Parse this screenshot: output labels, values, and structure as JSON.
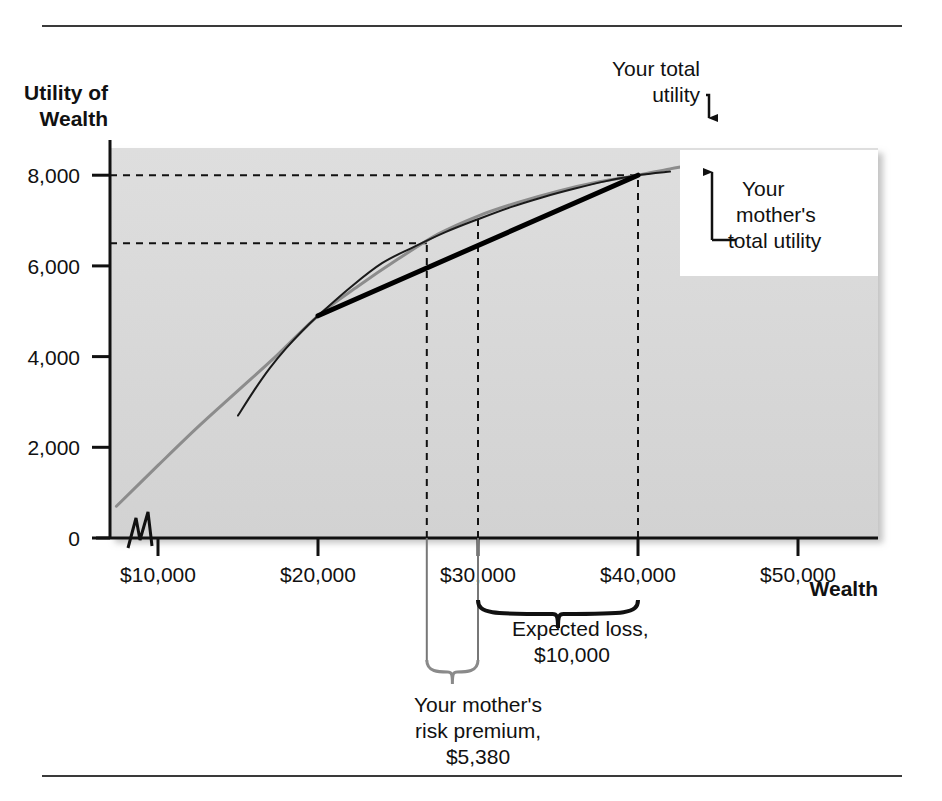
{
  "figure": {
    "background_color": "#ffffff",
    "plot_fill_color": "#d9d9d9",
    "your_curve_color": "#8c8c8c",
    "mother_curve_color": "#1a1a1a",
    "chord_color": "#000000"
  },
  "axes": {
    "y_title_line1": "Utility of",
    "y_title_line2": "Wealth",
    "x_title": "Wealth",
    "y_ticks": [
      "0",
      "2,000",
      "4,000",
      "6,000",
      "8,000"
    ],
    "x_ticks": [
      "$10,000",
      "$20,000",
      "$30,000",
      "$40,000",
      "$50,000"
    ],
    "axis_break_symbol": "zigzag"
  },
  "annotations": {
    "your_total_utility": "Your total\nutility",
    "your_total_utility_l1": "Your total",
    "your_total_utility_l2": "utility",
    "mothers_total_utility_l1": "Your",
    "mothers_total_utility_l2": "mother's",
    "mothers_total_utility_l3": "total utility",
    "expected_loss_l1": "Expected loss,",
    "expected_loss_l2": "$10,000",
    "risk_premium_l1": "Your mother's",
    "risk_premium_l2": "risk premium,",
    "risk_premium_l3": "$5,380"
  },
  "chart_data": {
    "type": "line",
    "title": "",
    "xlabel": "Wealth",
    "ylabel": "Utility of Wealth",
    "xlim": [
      7000,
      55000
    ],
    "ylim": [
      0,
      8600
    ],
    "xticks": [
      10000,
      20000,
      30000,
      40000,
      50000
    ],
    "xticklabels": [
      "$10,000",
      "$20,000",
      "$30,000",
      "$40,000",
      "$50,000"
    ],
    "yticks": [
      0,
      2000,
      4000,
      6000,
      8000
    ],
    "yticklabels": [
      "0",
      "2,000",
      "4,000",
      "6,000",
      "8,000"
    ],
    "grid": false,
    "legend": "none",
    "series": [
      {
        "name": "Your total utility",
        "color": "#8c8c8c",
        "width": 3,
        "points": [
          [
            7400,
            700
          ],
          [
            10000,
            1600
          ],
          [
            12500,
            2450
          ],
          [
            15000,
            3250
          ],
          [
            17500,
            4050
          ],
          [
            20000,
            4900
          ],
          [
            22500,
            5550
          ],
          [
            25000,
            6150
          ],
          [
            27500,
            6700
          ],
          [
            30000,
            7100
          ],
          [
            32500,
            7400
          ],
          [
            35000,
            7650
          ],
          [
            37500,
            7850
          ],
          [
            40000,
            8000
          ],
          [
            42000,
            8140
          ],
          [
            44000,
            8260
          ]
        ]
      },
      {
        "name": "Your mother's total utility",
        "color": "#1a1a1a",
        "width": 2,
        "points": [
          [
            15000,
            2700
          ],
          [
            16000,
            3250
          ],
          [
            17000,
            3750
          ],
          [
            18000,
            4180
          ],
          [
            19000,
            4560
          ],
          [
            20000,
            4900
          ],
          [
            22000,
            5520
          ],
          [
            24000,
            6060
          ],
          [
            26000,
            6420
          ],
          [
            28000,
            6750
          ],
          [
            30000,
            7030
          ],
          [
            32000,
            7290
          ],
          [
            34000,
            7510
          ],
          [
            36000,
            7700
          ],
          [
            38000,
            7870
          ],
          [
            40000,
            8000
          ],
          [
            42000,
            8080
          ]
        ]
      },
      {
        "name": "Chord from 20,000 to 40,000",
        "color": "#000000",
        "width": 5,
        "points": [
          [
            20000,
            4900
          ],
          [
            40000,
            8000
          ]
        ]
      }
    ],
    "markers": {
      "your_utility_at_40000": 8000,
      "mothers_certainty_equivalent_wealth": 26800,
      "mothers_expected_utility": 6500,
      "expected_wealth_with_loss": 30000,
      "wealth_no_loss": 40000,
      "expected_loss": 10000,
      "risk_premium": 5380
    },
    "reference_lines": [
      {
        "type": "horizontal",
        "y": 8000,
        "x_from": 7000,
        "x_to": 40000,
        "style": "dashed"
      },
      {
        "type": "horizontal",
        "y": 6500,
        "x_from": 7000,
        "x_to": 26800,
        "style": "dashed"
      },
      {
        "type": "vertical",
        "x": 26800,
        "y_from": 0,
        "y_to": 6500,
        "style": "dashed"
      },
      {
        "type": "vertical",
        "x": 30000,
        "y_from": 0,
        "y_to": 7100,
        "style": "dashed"
      },
      {
        "type": "vertical",
        "x": 40000,
        "y_from": 0,
        "y_to": 8000,
        "style": "dashed"
      }
    ]
  }
}
